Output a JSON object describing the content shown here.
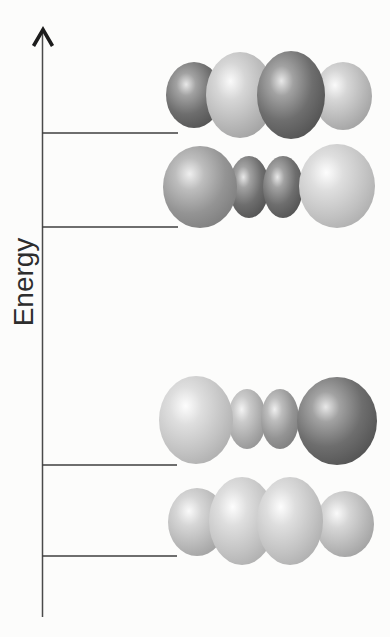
{
  "figure": {
    "background_color": "#fcfcfb",
    "axis": {
      "label": "Energy",
      "x": 42.5,
      "top_y": 33,
      "bottom_y": 617,
      "line_color": "#4a4a4a",
      "line_width": 1.5,
      "arrowhead": {
        "tip_x": 43,
        "tip_y": 29.5,
        "left_x": 33.5,
        "right_x": 52.5,
        "base_y": 46,
        "color": "#1c1c1c",
        "stroke_width": 3.6
      },
      "label_cx": 23,
      "label_cy": 282,
      "label_size": 28,
      "label_color": "#2d2d2d"
    },
    "level_line_color": "#3f3f3f",
    "level_line_width": 1.5,
    "levels": [
      {
        "name": "orbital-level-4-highest",
        "line": {
          "x1": 42,
          "x2": 178,
          "y": 133
        },
        "spheres": [
          {
            "cx": 194,
            "cy": 95,
            "rx": 28,
            "ry": 33,
            "shade": "dark"
          },
          {
            "cx": 343,
            "cy": 96,
            "rx": 29,
            "ry": 34,
            "shade": "light"
          },
          {
            "cx": 240,
            "cy": 95,
            "rx": 34,
            "ry": 43,
            "shade": "light"
          },
          {
            "cx": 291,
            "cy": 95,
            "rx": 34,
            "ry": 44,
            "shade": "dark"
          }
        ]
      },
      {
        "name": "orbital-level-3",
        "line": {
          "x1": 42,
          "x2": 178,
          "y": 227
        },
        "spheres": [
          {
            "cx": 249,
            "cy": 187,
            "rx": 20,
            "ry": 31,
            "shade": "dark"
          },
          {
            "cx": 283,
            "cy": 187,
            "rx": 20,
            "ry": 31,
            "shade": "dark"
          },
          {
            "cx": 200,
            "cy": 187,
            "rx": 37,
            "ry": 41,
            "shade": "medium"
          },
          {
            "cx": 337,
            "cy": 186,
            "rx": 38,
            "ry": 42,
            "shade": "lighter"
          }
        ]
      },
      {
        "name": "orbital-level-2",
        "line": {
          "x1": 42,
          "x2": 177,
          "y": 465
        },
        "spheres": [
          {
            "cx": 247,
            "cy": 419,
            "rx": 19,
            "ry": 30,
            "shade": "lightmed"
          },
          {
            "cx": 280,
            "cy": 419,
            "rx": 19,
            "ry": 30,
            "shade": "medium"
          },
          {
            "cx": 196,
            "cy": 420,
            "rx": 37,
            "ry": 44,
            "shade": "lighter"
          },
          {
            "cx": 337,
            "cy": 421,
            "rx": 40,
            "ry": 44,
            "shade": "dark"
          }
        ]
      },
      {
        "name": "orbital-level-1-lowest",
        "line": {
          "x1": 42,
          "x2": 177,
          "y": 556
        },
        "spheres": [
          {
            "cx": 197,
            "cy": 522,
            "rx": 29,
            "ry": 34,
            "shade": "light"
          },
          {
            "cx": 345,
            "cy": 524,
            "rx": 29,
            "ry": 33,
            "shade": "light"
          },
          {
            "cx": 242,
            "cy": 521,
            "rx": 33,
            "ry": 44,
            "shade": "lighter"
          },
          {
            "cx": 290,
            "cy": 521,
            "rx": 33,
            "ry": 44,
            "shade": "lighter"
          }
        ]
      }
    ],
    "shades": {
      "dark": {
        "stops": [
          {
            "offset": "0%",
            "color": "#e8e8e8"
          },
          {
            "offset": "22%",
            "color": "#a2a2a2"
          },
          {
            "offset": "58%",
            "color": "#6e6e6e"
          },
          {
            "offset": "100%",
            "color": "#4e4e4e"
          }
        ]
      },
      "medium": {
        "stops": [
          {
            "offset": "0%",
            "color": "#efefef"
          },
          {
            "offset": "25%",
            "color": "#bdbdbd"
          },
          {
            "offset": "62%",
            "color": "#949494"
          },
          {
            "offset": "100%",
            "color": "#7a7a7a"
          }
        ]
      },
      "lightmed": {
        "stops": [
          {
            "offset": "0%",
            "color": "#f3f3f3"
          },
          {
            "offset": "28%",
            "color": "#cacaca"
          },
          {
            "offset": "68%",
            "color": "#a8a8a8"
          },
          {
            "offset": "100%",
            "color": "#8f8f8f"
          }
        ]
      },
      "light": {
        "stops": [
          {
            "offset": "0%",
            "color": "#fafafa"
          },
          {
            "offset": "28%",
            "color": "#d6d6d6"
          },
          {
            "offset": "68%",
            "color": "#b6b6b6"
          },
          {
            "offset": "100%",
            "color": "#9d9d9d"
          }
        ]
      },
      "lighter": {
        "stops": [
          {
            "offset": "0%",
            "color": "#fdfdfd"
          },
          {
            "offset": "28%",
            "color": "#dedede"
          },
          {
            "offset": "68%",
            "color": "#c2c2c2"
          },
          {
            "offset": "100%",
            "color": "#aaaaaa"
          }
        ]
      }
    }
  }
}
